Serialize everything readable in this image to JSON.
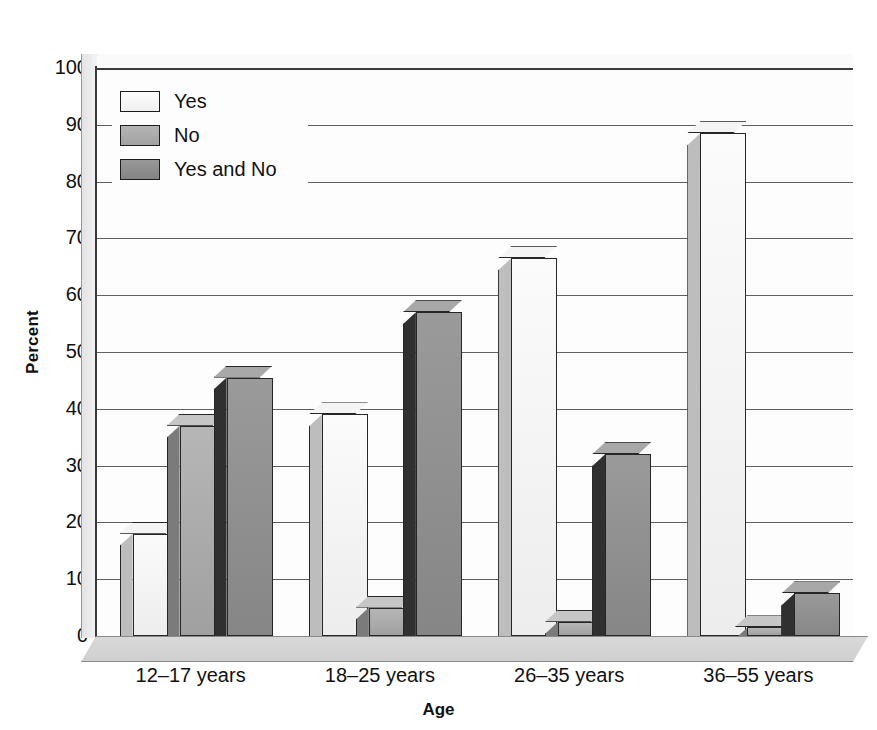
{
  "chart_data": {
    "type": "bar",
    "title": "",
    "xlabel": "Age",
    "ylabel": "Percent",
    "ylim": [
      0,
      100
    ],
    "ytick_step": 10,
    "grid": true,
    "legend_position": "top-left",
    "style": "3d-grouped-bar-grayscale",
    "categories": [
      "12–17 years",
      "18–25 years",
      "26–35 years",
      "36–55 years"
    ],
    "series": [
      {
        "name": "Yes",
        "color": "#f2f2f2",
        "values": [
          18,
          39,
          66.5,
          88.5
        ]
      },
      {
        "name": "No",
        "color": "#a8a8a8",
        "values": [
          37,
          5,
          2.5,
          1.5
        ]
      },
      {
        "name": "Yes and No",
        "color": "#8c8c8c",
        "values": [
          45.5,
          57,
          32,
          7.5
        ]
      }
    ],
    "ytick_labels": [
      "100",
      "90",
      "80",
      "70",
      "60",
      "50",
      "40",
      "30",
      "20",
      "10",
      "0"
    ]
  },
  "axes": {
    "y_title": "Percent",
    "x_title": "Age"
  },
  "legend": {
    "items": [
      {
        "label": "Yes"
      },
      {
        "label": "No"
      },
      {
        "label": "Yes and No"
      }
    ]
  }
}
